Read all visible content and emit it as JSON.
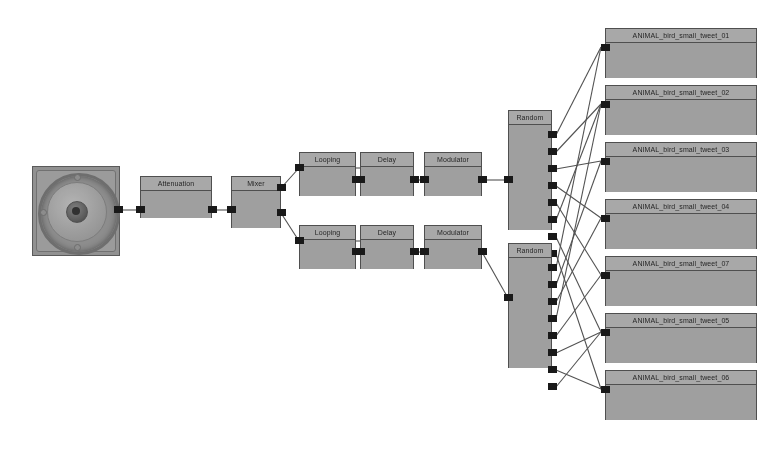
{
  "diagram": {
    "background_color": "#ffffff",
    "node_fill": "#9e9e9e",
    "node_border": "#4a4a4a",
    "wire_color": "#4d4d4d",
    "port_color": "#111111"
  },
  "source": {
    "name": "loudspeaker",
    "kind": "speaker-image"
  },
  "chain": {
    "attenuation_label": "Attenuation",
    "mixer_label": "Mixer"
  },
  "branches": [
    {
      "looping_label": "Looping",
      "delay_label": "Delay",
      "modulator_label": "Modulator"
    },
    {
      "looping_label": "Looping",
      "delay_label": "Delay",
      "modulator_label": "Modulator"
    }
  ],
  "routers": [
    {
      "label": "Random",
      "outputs": 8
    },
    {
      "label": "Random",
      "outputs": 8
    }
  ],
  "samples": [
    {
      "label": "ANIMAL_bird_small_tweet_01"
    },
    {
      "label": "ANIMAL_bird_small_tweet_02"
    },
    {
      "label": "ANIMAL_bird_small_tweet_03"
    },
    {
      "label": "ANIMAL_bird_small_tweet_04"
    },
    {
      "label": "ANIMAL_bird_small_tweet_07"
    },
    {
      "label": "ANIMAL_bird_small_tweet_05"
    },
    {
      "label": "ANIMAL_bird_small_tweet_06"
    },
    {
      "label": "ANIMAL_bird_small_tweet_08"
    }
  ]
}
